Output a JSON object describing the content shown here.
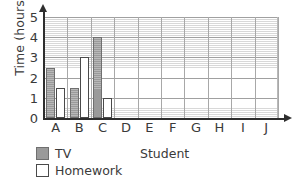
{
  "chart_data": {
    "type": "bar",
    "title": "",
    "xlabel": "Student",
    "ylabel": "Time (hours)",
    "categories": [
      "A",
      "B",
      "C",
      "D",
      "E",
      "F",
      "G",
      "H",
      "I",
      "J"
    ],
    "series": [
      {
        "name": "TV",
        "color": "#9a9a9a",
        "values": [
          2.5,
          1.5,
          4,
          null,
          null,
          null,
          null,
          null,
          null,
          null
        ]
      },
      {
        "name": "Homework",
        "color": "#ffffff",
        "values": [
          1.5,
          3,
          1,
          null,
          null,
          null,
          null,
          null,
          null,
          null
        ]
      }
    ],
    "ylim": [
      0,
      5
    ],
    "ytick_labels": [
      "0",
      "1",
      "2",
      "3",
      "4",
      "5"
    ],
    "ytick_values": [
      0,
      1,
      2,
      3,
      4,
      5
    ],
    "grid": true,
    "minor_gridlines_per_unit": 10,
    "legend_position": "below-left"
  },
  "axes": {
    "y_title": "Time (hours)",
    "x_title": "Student"
  },
  "legend": {
    "items": [
      {
        "label": "TV",
        "swatch": "tv"
      },
      {
        "label": "Homework",
        "swatch": "hw"
      }
    ]
  }
}
